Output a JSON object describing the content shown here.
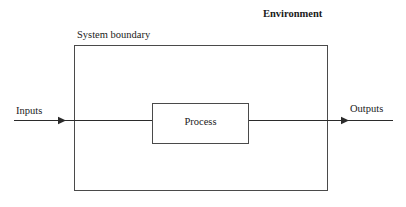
{
  "diagram": {
    "type": "system-context-block-diagram",
    "canvas": {
      "width": 406,
      "height": 207,
      "background": "#ffffff"
    },
    "colors": {
      "stroke": "#2b2b2b",
      "box_stroke": "#4a4a4a",
      "text": "#1a1a1a",
      "background": "#ffffff"
    },
    "labels": {
      "environment": "Environment",
      "system_boundary": "System boundary",
      "inputs": "Inputs",
      "outputs": "Outputs",
      "process": "Process"
    },
    "nodes": [
      {
        "id": "environment-label",
        "label": "Environment",
        "kind": "text",
        "bold": true,
        "x": 263,
        "y": 17
      },
      {
        "id": "system-boundary-label",
        "label": "System boundary",
        "kind": "text",
        "bold": false,
        "x": 77,
        "y": 38
      },
      {
        "id": "system-boundary-box",
        "label": "System boundary",
        "kind": "rect",
        "x": 74,
        "y": 45,
        "width": 253,
        "height": 145
      },
      {
        "id": "process-box",
        "label": "Process",
        "kind": "rect",
        "x": 152,
        "y": 103,
        "width": 96,
        "height": 40
      },
      {
        "id": "inputs-label",
        "label": "Inputs",
        "kind": "text",
        "bold": false,
        "x": 16,
        "y": 114
      },
      {
        "id": "outputs-label",
        "label": "Outputs",
        "kind": "text",
        "bold": false,
        "x": 350,
        "y": 112
      }
    ],
    "edges": [
      {
        "id": "input-flow",
        "from": "environment",
        "to": "process-box",
        "label": "Inputs",
        "x1": 14,
        "y1": 120,
        "x2": 152,
        "y2": 120,
        "arrowhead_x": 66,
        "arrowhead": "filled-triangle"
      },
      {
        "id": "output-flow",
        "from": "process-box",
        "to": "environment",
        "label": "Outputs",
        "x1": 248,
        "y1": 120,
        "x2": 393,
        "y2": 120,
        "arrowhead_x": 349,
        "arrowhead": "filled-triangle"
      }
    ]
  }
}
